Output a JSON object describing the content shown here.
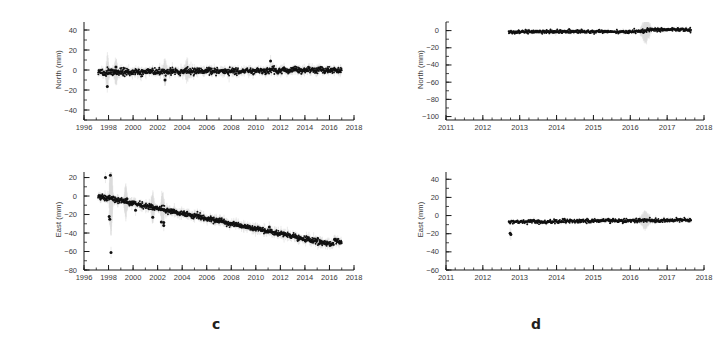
{
  "figure": {
    "panels": [
      {
        "letter": "c",
        "letter_x": 212,
        "letter_y": 316,
        "subplots": [
          {
            "id": "c-north",
            "ylabel": "North (mm)",
            "xlabel": "",
            "box": {
              "x": 58,
              "y": 18,
              "w": 300,
              "h": 118
            },
            "chart_data": {
              "type": "scatter",
              "title": "",
              "xlabel": "",
              "ylabel": "North (mm)",
              "xlim": [
                1996,
                2018
              ],
              "ylim": [
                -50,
                48
              ],
              "xticks": [
                1996,
                1998,
                2000,
                2002,
                2004,
                2006,
                2008,
                2010,
                2012,
                2014,
                2016,
                2018
              ],
              "xtick_labels": [
                "1996",
                "1998",
                "2000",
                "2002",
                "2004",
                "2006",
                "2008",
                "2010",
                "2012",
                "2014",
                "2016",
                "2018"
              ],
              "xminor_step": 1,
              "yticks": [
                40,
                20,
                0,
                -20,
                -40
              ],
              "ytick_labels": [
                "40",
                "20",
                "0",
                "−20",
                "−40"
              ],
              "yminor_step": 10,
              "grid": false,
              "legend": null,
              "series": [
                {
                  "name": "North displacement",
                  "color": "#111111",
                  "errorbar_color": "#bdbdbd",
                  "data_start_x": 1997.15,
                  "data_end_x": 2017.0,
                  "trend_slope_mm_per_yr": 0.12,
                  "trend_intercept_mm": -2.2,
                  "scatter_sigma_mm": 1.6,
                  "errorbar_sigma_mm": 4.0,
                  "n_points": 1100,
                  "outliers": [
                    {
                      "x": 1997.9,
                      "y": -16.5
                    },
                    {
                      "x": 2002.6,
                      "y": -10.0
                    },
                    {
                      "x": 2011.2,
                      "y": 9.0
                    },
                    {
                      "x": 1998.6,
                      "y": 3.0
                    }
                  ],
                  "noise_epochs": [
                    {
                      "x": 1997.9,
                      "spread": 12
                    },
                    {
                      "x": 1998.6,
                      "spread": 11
                    },
                    {
                      "x": 2002.6,
                      "spread": 10
                    },
                    {
                      "x": 2004.4,
                      "spread": 9
                    }
                  ]
                }
              ]
            }
          },
          {
            "id": "c-east",
            "ylabel": "East (mm)",
            "xlabel": "",
            "box": {
              "x": 58,
              "y": 168,
              "w": 300,
              "h": 118
            },
            "chart_data": {
              "type": "scatter",
              "title": "",
              "xlabel": "",
              "ylabel": "East (mm)",
              "xlim": [
                1996,
                2018
              ],
              "ylim": [
                -80,
                26
              ],
              "xticks": [
                1996,
                1998,
                2000,
                2002,
                2004,
                2006,
                2008,
                2010,
                2012,
                2014,
                2016,
                2018
              ],
              "xtick_labels": [
                "1996",
                "1998",
                "2000",
                "2002",
                "2004",
                "2006",
                "2008",
                "2010",
                "2012",
                "2014",
                "2016",
                "2018"
              ],
              "xminor_step": 1,
              "yticks": [
                20,
                0,
                -20,
                -40,
                -60,
                -80
              ],
              "ytick_labels": [
                "20",
                "0",
                "−20",
                "−40",
                "−60",
                "−80"
              ],
              "yminor_step": 10,
              "grid": false,
              "legend": null,
              "series": [
                {
                  "name": "East displacement",
                  "color": "#111111",
                  "errorbar_color": "#bdbdbd",
                  "data_start_x": 1997.15,
                  "data_end_x": 2017.0,
                  "trend_slope_mm_per_yr": -2.75,
                  "trend_intercept_mm": 0.0,
                  "scatter_sigma_mm": 1.4,
                  "errorbar_sigma_mm": 4.5,
                  "n_points": 1100,
                  "offset_events": [
                    {
                      "x": 2016.35,
                      "step_mm": 5.0
                    }
                  ],
                  "outliers": [
                    {
                      "x": 1997.75,
                      "y": 20.0
                    },
                    {
                      "x": 1998.15,
                      "y": 22.5
                    },
                    {
                      "x": 1998.2,
                      "y": -61.0
                    },
                    {
                      "x": 1998.05,
                      "y": -22.0
                    },
                    {
                      "x": 1998.1,
                      "y": -25.0
                    },
                    {
                      "x": 1999.5,
                      "y": -3.0
                    },
                    {
                      "x": 2000.2,
                      "y": -15.5
                    },
                    {
                      "x": 2002.3,
                      "y": -28.0
                    },
                    {
                      "x": 2002.5,
                      "y": -28.5
                    },
                    {
                      "x": 2002.5,
                      "y": -32.0
                    },
                    {
                      "x": 2001.6,
                      "y": -23.0
                    },
                    {
                      "x": 2010.0,
                      "y": -34.5
                    },
                    {
                      "x": 2011.1,
                      "y": -33.5
                    },
                    {
                      "x": 2015.3,
                      "y": -51.0
                    }
                  ],
                  "noise_epochs": [
                    {
                      "x": 1998.2,
                      "spread": 40
                    },
                    {
                      "x": 1999.4,
                      "spread": 16
                    },
                    {
                      "x": 2001.6,
                      "spread": 14
                    },
                    {
                      "x": 2002.4,
                      "spread": 16
                    }
                  ]
                }
              ]
            }
          }
        ]
      },
      {
        "letter": "d",
        "letter_x": 531,
        "letter_y": 316,
        "subplots": [
          {
            "id": "d-north",
            "ylabel": "North (mm)",
            "xlabel": "",
            "box": {
              "x": 420,
              "y": 18,
              "w": 288,
              "h": 118
            },
            "chart_data": {
              "type": "scatter",
              "title": "",
              "xlabel": "",
              "ylabel": "North (mm)",
              "xlim": [
                2011,
                2018
              ],
              "ylim": [
                -104,
                10
              ],
              "xticks": [
                2011,
                2012,
                2013,
                2014,
                2015,
                2016,
                2017,
                2018
              ],
              "xtick_labels": [
                "2011",
                "2012",
                "2013",
                "2014",
                "2015",
                "2016",
                "2017",
                "2018"
              ],
              "xminor_step": 0.25,
              "yticks": [
                0,
                -20,
                -40,
                -60,
                -80,
                -100
              ],
              "ytick_labels": [
                "0",
                "−20",
                "−40",
                "−60",
                "−80",
                "−100"
              ],
              "yminor_step": 10,
              "grid": false,
              "legend": null,
              "series": [
                {
                  "name": "North displacement",
                  "color": "#111111",
                  "errorbar_color": "#bdbdbd",
                  "data_start_x": 2012.7,
                  "data_end_x": 2017.65,
                  "trend_slope_mm_per_yr": 0.1,
                  "trend_intercept_mm": -1.3,
                  "scatter_sigma_mm": 1.0,
                  "errorbar_sigma_mm": 2.0,
                  "n_points": 620,
                  "offset_events": [
                    {
                      "x": 2016.45,
                      "step_mm": 2.2
                    }
                  ],
                  "outliers": [],
                  "noise_epochs": [
                    {
                      "x": 2016.42,
                      "spread": 13
                    }
                  ]
                }
              ]
            }
          },
          {
            "id": "d-east",
            "ylabel": "East (mm)",
            "xlabel": "",
            "box": {
              "x": 420,
              "y": 168,
              "w": 288,
              "h": 118
            },
            "chart_data": {
              "type": "scatter",
              "title": "",
              "xlabel": "",
              "ylabel": "East (mm)",
              "xlim": [
                2011,
                2018
              ],
              "ylim": [
                -60,
                48
              ],
              "xticks": [
                2011,
                2012,
                2013,
                2014,
                2015,
                2016,
                2017,
                2018
              ],
              "xtick_labels": [
                "2011",
                "2012",
                "2013",
                "2014",
                "2015",
                "2016",
                "2017",
                "2018"
              ],
              "xminor_step": 0.25,
              "yticks": [
                40,
                20,
                0,
                -20,
                -40,
                -60
              ],
              "ytick_labels": [
                "40",
                "20",
                "0",
                "−20",
                "−40",
                "−60"
              ],
              "yminor_step": 10,
              "grid": false,
              "legend": null,
              "series": [
                {
                  "name": "East displacement",
                  "color": "#111111",
                  "errorbar_color": "#bdbdbd",
                  "data_start_x": 2012.7,
                  "data_end_x": 2017.65,
                  "trend_slope_mm_per_yr": 0.42,
                  "trend_intercept_mm": -7.0,
                  "scatter_sigma_mm": 1.0,
                  "errorbar_sigma_mm": 2.0,
                  "n_points": 620,
                  "offset_events": [],
                  "outliers": [
                    {
                      "x": 2012.74,
                      "y": -19.5
                    },
                    {
                      "x": 2012.76,
                      "y": -21.0
                    }
                  ],
                  "noise_epochs": [
                    {
                      "x": 2016.4,
                      "spread": 9
                    }
                  ]
                }
              ]
            }
          }
        ]
      }
    ]
  }
}
